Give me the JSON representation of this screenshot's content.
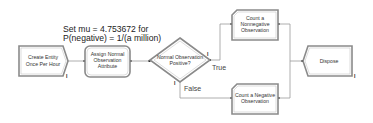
{
  "annotation": {
    "line1": "Set mu = 4.753672 for",
    "line2": "P(negative) = 1/(a million)"
  },
  "modules": {
    "create": {
      "type": "Create",
      "lines": [
        "Create Entity",
        "Once Per Hour"
      ]
    },
    "assign": {
      "type": "Assign",
      "lines": [
        "Assign Normal",
        "Observation",
        "Attribute"
      ]
    },
    "decide": {
      "type": "Decide",
      "lines": [
        "Normal Observation",
        "Positive?"
      ]
    },
    "record_nonneg": {
      "type": "Record",
      "lines": [
        "Count a",
        "Nonnegative",
        "Observation"
      ]
    },
    "record_neg": {
      "type": "Record",
      "lines": [
        "Count a Negative",
        "Observation"
      ]
    },
    "dispose": {
      "type": "Dispose",
      "lines": [
        "Dispose"
      ]
    }
  },
  "branches": {
    "true_label": "True",
    "false_label": "False"
  },
  "exit_marker": "I",
  "colors": {
    "shape_stroke": "#8a8a8a",
    "shape_fill": "#ffffff",
    "connector": "#9a9a9a"
  }
}
